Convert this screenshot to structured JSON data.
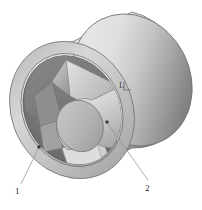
{
  "figure": {
    "kind": "technical-illustration",
    "background_color": "#ffffff"
  },
  "callouts": [
    {
      "id": "callout-1",
      "label": "1",
      "label_x": 17,
      "label_y": 191,
      "dot_x": 39,
      "dot_y": 147,
      "line_x1": 37,
      "line_y1": 149,
      "line_x2": 21,
      "line_y2": 184
    },
    {
      "id": "callout-2",
      "label": "2",
      "label_x": 146,
      "label_y": 187,
      "dot_x": 107,
      "dot_y": 122,
      "line_x1": 108,
      "line_y1": 123,
      "line_x2": 148,
      "line_y2": 180
    }
  ],
  "dimensions": [
    {
      "id": "dim-length",
      "label": "L",
      "label_x": 121,
      "label_y": 85,
      "tick_x": 127,
      "tick_y": 88
    }
  ],
  "colors": {
    "outer_shell_light": "#e3e3e3",
    "outer_shell_mid": "#c9c9c9",
    "outer_shell_dark": "#7b7b7b",
    "outer_shell_darkest": "#6e6e6e",
    "rim_face_light": "#d4d4d4",
    "rim_face_mid": "#b4b4b4",
    "bore_shadow": "#707070",
    "bore_shadow_deep": "#5f5f5f",
    "vane_light": "#dcdcdc",
    "vane_mid": "#bcbcbc",
    "vane_dark": "#8f8f8f",
    "hub_body": "#c4c4c4",
    "hub_face": "#b3b3b3",
    "outline": "#6a6a6a",
    "leader": "#8c8c8c",
    "text": "#2b2b2b"
  },
  "geometry": {
    "front_rim_outer": {
      "cx": 72,
      "cy": 110,
      "rx": 58,
      "ry": 68,
      "rot": -27
    },
    "front_rim_inner": {
      "cx": 72,
      "cy": 110,
      "rx": 47,
      "ry": 56,
      "rot": -27
    },
    "back_rim_outer": {
      "cx": 132,
      "cy": 80,
      "rx": 58,
      "ry": 68,
      "rot": -27
    },
    "hub_face": {
      "cx": 80,
      "cy": 126,
      "rx": 23,
      "ry": 26,
      "rot": -20
    },
    "hub_back": {
      "cx": 109,
      "cy": 110,
      "rx": 23,
      "ry": 26,
      "rot": -20
    }
  }
}
